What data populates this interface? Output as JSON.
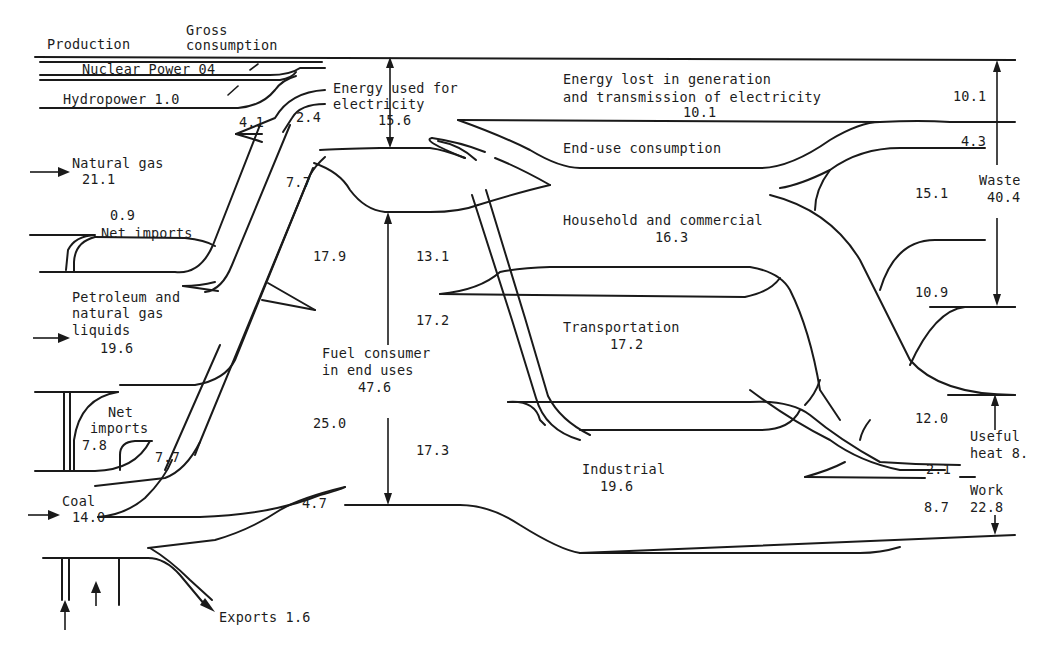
{
  "diagram": {
    "type": "energy-flow",
    "colors": {
      "ink": "#1a1a1a",
      "background": "#ffffff"
    },
    "headers": {
      "production": "Production",
      "gross_consumption_1": "Gross",
      "gross_consumption_2": "consumption"
    },
    "sources": {
      "nuclear": "Nuclear Power 04",
      "hydro": "Hydropower 1.0",
      "natural_gas_label": "Natural gas",
      "natural_gas_value": "21.1",
      "ng_imports_value": "0.9",
      "ng_imports_label": "Net imports",
      "petroleum_1": "Petroleum and",
      "petroleum_2": "natural gas",
      "petroleum_3": "liquids",
      "petroleum_value": "19.6",
      "pet_imports_1": "Net",
      "pet_imports_2": "imports",
      "pet_imports_value": "7.8",
      "coal_label": "Coal",
      "coal_value": "14.0",
      "exports": "Exports 1.6"
    },
    "flows": {
      "v_4_1": "4.1",
      "v_2_4": "2.4",
      "v_7_7_upper": "7.7",
      "v_17_9": "17.9",
      "v_7_7_lower": "7.7",
      "v_25_0": "25.0",
      "v_4_7": "4.7",
      "v_13_1": "13.1",
      "v_17_2": "17.2",
      "v_17_3": "17.3"
    },
    "middle": {
      "electricity_1": "Energy used for",
      "electricity_2": "electricity",
      "electricity_value": "15.6",
      "fuel_1": "Fuel consumer",
      "fuel_2": "in end uses",
      "fuel_value": "47.6"
    },
    "end_use": {
      "lost_1": "Energy lost in generation",
      "lost_2": "and transmission of electricity",
      "lost_value": "10.1",
      "end_use_label": "End-use consumption",
      "household_label": "Household and commercial",
      "household_value": "16.3",
      "transport_label": "Transportation",
      "transport_value": "17.2",
      "industrial_label": "Industrial",
      "industrial_value": "19.6"
    },
    "outputs": {
      "r_10_1": "10.1",
      "r_4_3": "4.3",
      "r_15_1": "15.1",
      "r_10_9": "10.9",
      "r_12_0": "12.0",
      "r_2_1": "2.1",
      "r_8_7": "8.7",
      "waste_label": "Waste",
      "waste_value": "40.4",
      "useful_1": "Useful",
      "useful_2": "heat 8.",
      "work_label": "Work",
      "work_value": "22.8"
    }
  }
}
